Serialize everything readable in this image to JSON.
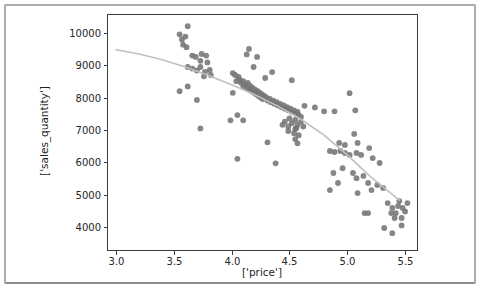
{
  "figure": {
    "background": "#ffffff",
    "frame_color": "#aeaeae",
    "spine_color": "#3d3d3d"
  },
  "chart_data": {
    "type": "scatter",
    "title": "",
    "xlabel": "['price']",
    "ylabel": "['sales_quantity']",
    "xlim": [
      2.922,
      5.612
    ],
    "ylim": [
      3258,
      10588
    ],
    "grid": false,
    "legend": "none",
    "x_ticks": [
      3.0,
      3.5,
      4.0,
      4.5,
      5.0,
      5.5
    ],
    "x_tick_labels": [
      "3.0",
      "3.5",
      "4.0",
      "4.5",
      "5.0",
      "5.5"
    ],
    "y_ticks": [
      4000,
      5000,
      6000,
      7000,
      8000,
      9000,
      10000
    ],
    "y_tick_labels": [
      "4000",
      "5000",
      "6000",
      "7000",
      "8000",
      "9000",
      "10000"
    ],
    "point_color": "#757575",
    "point_radius_px": 2.9,
    "line_color": "#bfc2ba",
    "points": [
      [
        3.62,
        10210
      ],
      [
        3.55,
        9960
      ],
      [
        3.57,
        9800
      ],
      [
        3.6,
        9890
      ],
      [
        3.58,
        9640
      ],
      [
        3.61,
        9560
      ],
      [
        3.66,
        9300
      ],
      [
        3.69,
        9260
      ],
      [
        3.74,
        9350
      ],
      [
        3.78,
        9300
      ],
      [
        3.73,
        9140
      ],
      [
        3.79,
        9090
      ],
      [
        3.62,
        8950
      ],
      [
        3.66,
        8900
      ],
      [
        3.7,
        8840
      ],
      [
        3.73,
        8950
      ],
      [
        3.77,
        8800
      ],
      [
        3.81,
        8860
      ],
      [
        3.82,
        8700
      ],
      [
        3.76,
        8660
      ],
      [
        3.55,
        8200
      ],
      [
        3.62,
        8350
      ],
      [
        3.7,
        7930
      ],
      [
        3.73,
        7050
      ],
      [
        4.15,
        9510
      ],
      [
        4.13,
        9340
      ],
      [
        4.22,
        9260
      ],
      [
        4.19,
        8950
      ],
      [
        4.35,
        8790
      ],
      [
        4.52,
        8540
      ],
      [
        4.29,
        8610
      ],
      [
        4.01,
        8150
      ],
      [
        4.01,
        8760
      ],
      [
        4.03,
        8700
      ],
      [
        4.06,
        8640
      ],
      [
        4.04,
        8510
      ],
      [
        4.07,
        8560
      ],
      [
        4.08,
        8460
      ],
      [
        4.1,
        8510
      ],
      [
        4.1,
        8360
      ],
      [
        4.12,
        8410
      ],
      [
        4.13,
        8300
      ],
      [
        4.14,
        8460
      ],
      [
        4.15,
        8250
      ],
      [
        4.16,
        8360
      ],
      [
        4.17,
        8210
      ],
      [
        4.18,
        8310
      ],
      [
        4.19,
        8160
      ],
      [
        4.2,
        8260
      ],
      [
        4.21,
        8110
      ],
      [
        4.22,
        8210
      ],
      [
        4.23,
        8060
      ],
      [
        4.24,
        8160
      ],
      [
        4.25,
        8010
      ],
      [
        4.26,
        8110
      ],
      [
        4.27,
        7960
      ],
      [
        4.28,
        8060
      ],
      [
        4.3,
        8010
      ],
      [
        4.31,
        7910
      ],
      [
        4.33,
        7960
      ],
      [
        4.34,
        7860
      ],
      [
        4.36,
        7910
      ],
      [
        4.37,
        7810
      ],
      [
        4.39,
        7860
      ],
      [
        4.4,
        7760
      ],
      [
        4.42,
        7810
      ],
      [
        4.43,
        7710
      ],
      [
        4.45,
        7760
      ],
      [
        4.46,
        7660
      ],
      [
        4.48,
        7710
      ],
      [
        4.49,
        7610
      ],
      [
        4.51,
        7660
      ],
      [
        4.52,
        7560
      ],
      [
        4.54,
        7610
      ],
      [
        4.55,
        7510
      ],
      [
        4.57,
        7560
      ],
      [
        4.58,
        7460
      ],
      [
        4.6,
        7410
      ],
      [
        4.55,
        7310
      ],
      [
        4.5,
        7360
      ],
      [
        4.46,
        7260
      ],
      [
        4.52,
        7210
      ],
      [
        4.57,
        7160
      ],
      [
        4.6,
        7260
      ],
      [
        4.62,
        7110
      ],
      [
        4.56,
        7060
      ],
      [
        4.49,
        7110
      ],
      [
        4.44,
        7160
      ],
      [
        4.49,
        6970
      ],
      [
        4.54,
        6900
      ],
      [
        4.58,
        6840
      ],
      [
        4.57,
        6590
      ],
      [
        4.55,
        6720
      ],
      [
        4.05,
        7460
      ],
      [
        3.99,
        7300
      ],
      [
        4.1,
        7300
      ],
      [
        4.31,
        6620
      ],
      [
        4.55,
        7030
      ],
      [
        4.05,
        6110
      ],
      [
        4.38,
        5970
      ],
      [
        4.63,
        7750
      ],
      [
        4.72,
        7700
      ],
      [
        4.8,
        7580
      ],
      [
        4.89,
        7580
      ],
      [
        5.07,
        7610
      ],
      [
        5.02,
        8140
      ],
      [
        5.06,
        6880
      ],
      [
        4.85,
        6350
      ],
      [
        4.89,
        6320
      ],
      [
        4.94,
        6350
      ],
      [
        4.98,
        6290
      ],
      [
        5.02,
        6230
      ],
      [
        5.08,
        6290
      ],
      [
        5.12,
        6230
      ],
      [
        4.93,
        6600
      ],
      [
        4.98,
        6540
      ],
      [
        5.09,
        6600
      ],
      [
        5.19,
        6440
      ],
      [
        5.22,
        6130
      ],
      [
        5.28,
        5980
      ],
      [
        4.88,
        5670
      ],
      [
        4.92,
        5360
      ],
      [
        4.85,
        5140
      ],
      [
        4.96,
        5820
      ],
      [
        5.05,
        5670
      ],
      [
        5.08,
        5510
      ],
      [
        5.14,
        5580
      ],
      [
        5.18,
        5360
      ],
      [
        5.21,
        5140
      ],
      [
        5.26,
        5300
      ],
      [
        5.31,
        5210
      ],
      [
        5.09,
        5050
      ],
      [
        5.35,
        4740
      ],
      [
        5.39,
        4590
      ],
      [
        5.44,
        4650
      ],
      [
        5.48,
        4590
      ],
      [
        5.42,
        4430
      ],
      [
        5.38,
        4430
      ],
      [
        5.47,
        4280
      ],
      [
        5.41,
        4280
      ],
      [
        5.32,
        3970
      ],
      [
        5.39,
        3810
      ],
      [
        5.47,
        4050
      ],
      [
        5.15,
        4430
      ],
      [
        5.18,
        4430
      ],
      [
        5.52,
        4740
      ],
      [
        5.5,
        4480
      ],
      [
        5.45,
        4800
      ]
    ],
    "trend_line": [
      [
        3.0,
        9480
      ],
      [
        3.2,
        9350
      ],
      [
        3.4,
        9170
      ],
      [
        3.6,
        8950
      ],
      [
        3.8,
        8690
      ],
      [
        4.0,
        8400
      ],
      [
        4.2,
        8090
      ],
      [
        4.4,
        7740
      ],
      [
        4.6,
        7330
      ],
      [
        4.8,
        6840
      ],
      [
        5.0,
        6230
      ],
      [
        5.2,
        5560
      ],
      [
        5.45,
        4830
      ]
    ]
  }
}
